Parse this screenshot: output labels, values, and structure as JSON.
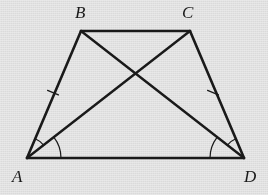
{
  "figure": {
    "background_color": "#e9e9e9",
    "stroke_color": "#1a1a1a",
    "labels": {
      "a": "A",
      "b": "B",
      "c": "C",
      "d": "D"
    },
    "vertices": {
      "A": {
        "x": 27,
        "y": 158
      },
      "B": {
        "x": 81,
        "y": 31
      },
      "C": {
        "x": 190,
        "y": 31
      },
      "D": {
        "x": 244,
        "y": 158
      }
    },
    "label_positions": {
      "A": {
        "x": 12,
        "y": 168
      },
      "B": {
        "x": 75,
        "y": 4
      },
      "C": {
        "x": 182,
        "y": 4
      },
      "D": {
        "x": 244,
        "y": 168
      }
    },
    "segments": [
      {
        "name": "side-AB",
        "from": "A",
        "to": "B",
        "kind": "leg"
      },
      {
        "name": "side-BC",
        "from": "B",
        "to": "C",
        "kind": "top-base"
      },
      {
        "name": "side-CD",
        "from": "C",
        "to": "D",
        "kind": "leg"
      },
      {
        "name": "side-AD",
        "from": "A",
        "to": "D",
        "kind": "bottom-base"
      },
      {
        "name": "diagonal-AC",
        "from": "A",
        "to": "C",
        "kind": "diagonal"
      },
      {
        "name": "diagonal-BD",
        "from": "B",
        "to": "D",
        "kind": "diagonal"
      }
    ],
    "intersection": {
      "name": "diagonal-intersection",
      "x": 136,
      "y": 77
    },
    "tick_marks": [
      {
        "name": "tick-mark-AB",
        "x": 53,
        "y": 93,
        "on": "side-AB",
        "count": 1
      },
      {
        "name": "tick-mark-CD",
        "x": 213,
        "y": 93,
        "on": "side-CD",
        "count": 1
      }
    ],
    "angle_arcs": [
      {
        "name": "angle-arc-BAC",
        "vertex": "A",
        "radius": 21,
        "between": [
          "AB",
          "AC"
        ]
      },
      {
        "name": "angle-arc-CAD",
        "vertex": "A",
        "radius": 34,
        "between": [
          "AC",
          "AD"
        ]
      },
      {
        "name": "angle-arc-CDB",
        "vertex": "D",
        "radius": 21,
        "between": [
          "DC",
          "DB"
        ]
      },
      {
        "name": "angle-arc-BDA",
        "vertex": "D",
        "radius": 34,
        "between": [
          "DB",
          "DA"
        ]
      }
    ],
    "stroke_widths": {
      "side": 2.6,
      "diagonal": 2.4,
      "arc": 1.2,
      "tick": 1.3
    }
  }
}
